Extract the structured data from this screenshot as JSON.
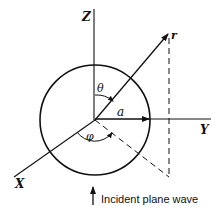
{
  "diagram": {
    "axes": {
      "z_label": "Z",
      "y_label": "Y",
      "x_label": "X"
    },
    "labels": {
      "radius": "a",
      "position_vector": "r",
      "polar_angle": "θ",
      "azimuth_angle": "φ"
    },
    "caption": "Incident plane wave",
    "colors": {
      "stroke": "#111111",
      "background": "#ffffff"
    }
  }
}
